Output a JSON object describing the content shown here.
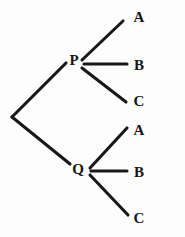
{
  "diagram": {
    "type": "tree-diagram",
    "title": "",
    "canvas": {
      "width": 185,
      "height": 237,
      "background": "#fdfdfd"
    },
    "style": {
      "line_color": "#181818",
      "line_width": 3.1,
      "text_color": "#151515"
    },
    "root": {
      "name": "root-vertex",
      "x": 12,
      "y": 117,
      "label": ""
    },
    "nodes": [
      {
        "id": "p",
        "label": "P",
        "x": 74,
        "y": 60,
        "anchor_x": 82,
        "anchor_y": 63
      },
      {
        "id": "q",
        "label": "Q",
        "x": 78,
        "y": 169,
        "anchor_x": 89,
        "anchor_y": 171
      }
    ],
    "leaves": [
      {
        "id": "p-a",
        "label": "A",
        "x": 139,
        "y": 17,
        "parent": "p"
      },
      {
        "id": "p-b",
        "label": "B",
        "x": 139,
        "y": 65,
        "parent": "p"
      },
      {
        "id": "p-c",
        "label": "C",
        "x": 139,
        "y": 101,
        "parent": "p"
      },
      {
        "id": "q-a",
        "label": "A",
        "x": 139,
        "y": 130,
        "parent": "q"
      },
      {
        "id": "q-b",
        "label": "B",
        "x": 139,
        "y": 172,
        "parent": "q"
      },
      {
        "id": "q-c",
        "label": "C",
        "x": 139,
        "y": 218,
        "parent": "q"
      }
    ],
    "edges": [
      {
        "id": "root-p",
        "from": "root",
        "to": "p",
        "x1": 12,
        "y1": 117,
        "x2": 66,
        "y2": 63,
        "label": ""
      },
      {
        "id": "root-q",
        "from": "root",
        "to": "q",
        "x1": 12,
        "y1": 117,
        "x2": 70,
        "y2": 164,
        "label": ""
      },
      {
        "id": "p-a-edge",
        "from": "p",
        "to": "p-a",
        "x1": 82,
        "y1": 60,
        "x2": 123,
        "y2": 21,
        "label": ""
      },
      {
        "id": "p-b-edge",
        "from": "p",
        "to": "p-b",
        "x1": 84,
        "y1": 64,
        "x2": 127,
        "y2": 64,
        "label": ""
      },
      {
        "id": "p-c-edge",
        "from": "p",
        "to": "p-c",
        "x1": 82,
        "y1": 68,
        "x2": 126,
        "y2": 102,
        "label": ""
      },
      {
        "id": "q-a-edge",
        "from": "q",
        "to": "q-a",
        "x1": 90,
        "y1": 168,
        "x2": 127,
        "y2": 128,
        "label": ""
      },
      {
        "id": "q-b-edge",
        "from": "q",
        "to": "q-b",
        "x1": 91,
        "y1": 171,
        "x2": 127,
        "y2": 171,
        "label": ""
      },
      {
        "id": "q-c-edge",
        "from": "q",
        "to": "q-c",
        "x1": 90,
        "y1": 175,
        "x2": 128,
        "y2": 215,
        "label": ""
      }
    ]
  }
}
